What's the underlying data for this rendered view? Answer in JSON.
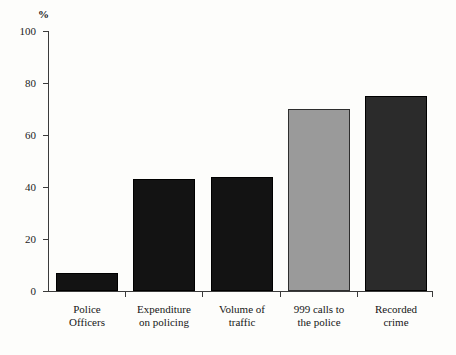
{
  "chart_data": {
    "type": "bar",
    "title": "",
    "subtitle": "",
    "xlabel": "",
    "ylabel": "%",
    "ylim": [
      0,
      100
    ],
    "yticks": [
      0,
      20,
      40,
      60,
      80,
      100
    ],
    "grid": false,
    "legend": "none",
    "categories": [
      "Police Officers",
      "Expenditure on policing",
      "Volume of traffic",
      "999 calls to the police",
      "Recorded crime"
    ],
    "category_lines": [
      [
        "Police",
        "Officers"
      ],
      [
        "Expenditure",
        "on policing"
      ],
      [
        "Volume of",
        "traffic"
      ],
      [
        "999 calls to",
        "the police"
      ],
      [
        "Recorded",
        "crime"
      ]
    ],
    "values": [
      7,
      43,
      44,
      70,
      75
    ],
    "bar_colors": [
      "#131313",
      "#131313",
      "#131313",
      "#9a9a9a",
      "#2b2b2b"
    ],
    "bar_edge_colors": [
      "#000000",
      "#000000",
      "#000000",
      "#2e2e2e",
      "#000000"
    ]
  },
  "axis": {
    "unit_caption": "%",
    "tick_labels": [
      "0",
      "20",
      "40",
      "60",
      "80",
      "100"
    ]
  },
  "colors": {
    "background": "#fdfdfb",
    "axis": "#3b3b3b",
    "text": "#161616",
    "bar_dark": "#131313",
    "bar_gray": "#9a9a9a",
    "bar_darkgray": "#2b2b2b"
  }
}
